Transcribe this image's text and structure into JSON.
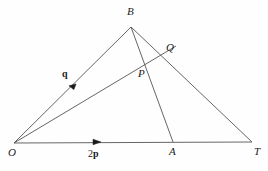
{
  "figure": {
    "background_color": "#fefefe",
    "stroke_color": "#555555",
    "label_color": "#1a1a1a",
    "width": 268,
    "height": 171,
    "points": [
      {
        "id": "O",
        "label": "O",
        "x": 14,
        "y": 143,
        "label_x": 8,
        "label_y": 147
      },
      {
        "id": "B",
        "label": "B",
        "x": 131,
        "y": 27,
        "label_x": 127,
        "label_y": 7
      },
      {
        "id": "Q",
        "label": "Q",
        "x": 163,
        "y": 55,
        "label_x": 166,
        "label_y": 43
      },
      {
        "id": "P",
        "label": "P",
        "x": 147,
        "y": 70,
        "label_x": 139,
        "label_y": 70
      },
      {
        "id": "A",
        "label": "A",
        "x": 173,
        "y": 142,
        "label_x": 170,
        "label_y": 147
      },
      {
        "id": "T",
        "label": "T",
        "x": 252,
        "y": 142,
        "label_x": 254,
        "label_y": 147
      }
    ],
    "segments": [
      {
        "id": "O-B",
        "from": "O",
        "to": "B"
      },
      {
        "id": "O-T",
        "from": "O",
        "to": "T"
      },
      {
        "id": "B-T",
        "from": "B",
        "to": "T"
      },
      {
        "id": "B-A",
        "from": "B",
        "to": "A"
      },
      {
        "id": "O-Q",
        "from": "O",
        "to": "Q"
      }
    ],
    "vectors": [
      {
        "id": "q",
        "label_num": "",
        "label_bold": "q",
        "on_segment": "O-B",
        "arrow_x": 76,
        "arrow_y": 84,
        "label_x": 62,
        "label_y": 70
      },
      {
        "id": "2p",
        "label_num": "2",
        "label_bold": "p",
        "on_segment": "O-T",
        "arrow_x": 100,
        "arrow_y": 142,
        "label_x": 88,
        "label_y": 150
      }
    ]
  }
}
